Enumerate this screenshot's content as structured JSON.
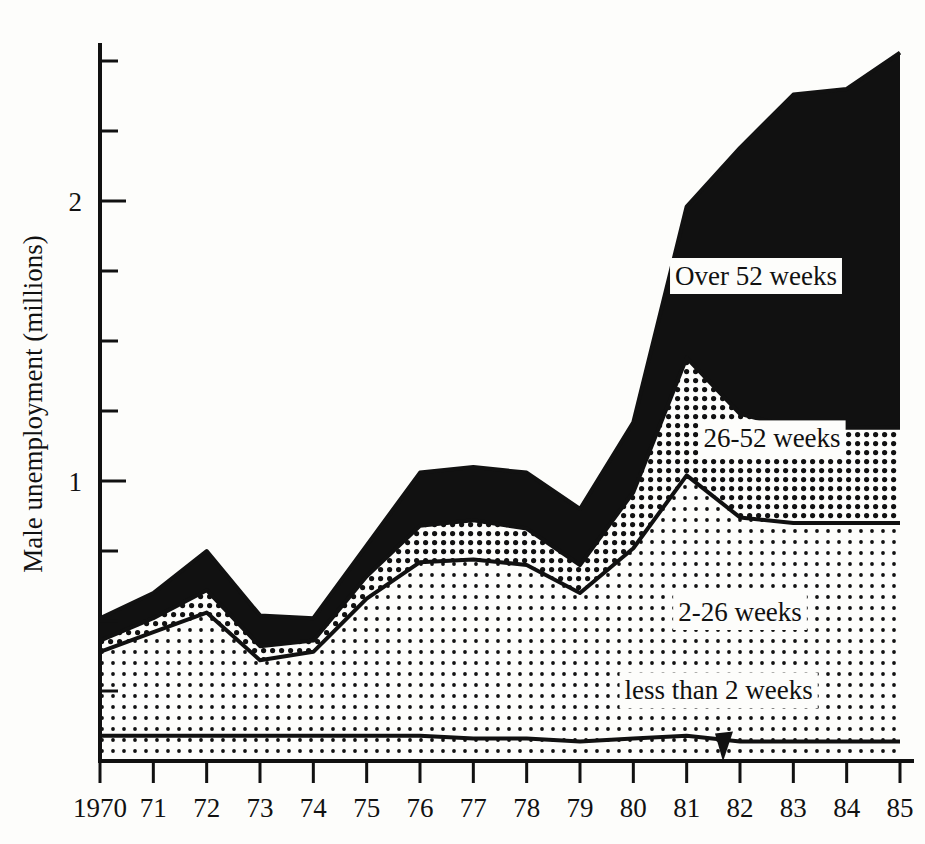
{
  "chart_data": {
    "type": "area",
    "title": "",
    "subtitle": "",
    "xlabel": "",
    "ylabel": "Male unemployment (millions)",
    "stacked": true,
    "grid": false,
    "legend_position": "inline-annotations",
    "xlim": [
      1970,
      1985
    ],
    "ylim": [
      0,
      2.55
    ],
    "yticks_major": [
      1,
      2
    ],
    "yticks_major_labels": [
      "1",
      "2"
    ],
    "ytick_interval_minor": 0.25,
    "x": [
      1970,
      1971,
      1972,
      1973,
      1974,
      1975,
      1976,
      1977,
      1978,
      1979,
      1980,
      1981,
      1982,
      1983,
      1984,
      1985
    ],
    "xtick_labels": [
      "1970",
      "71",
      "72",
      "73",
      "74",
      "75",
      "76",
      "77",
      "78",
      "79",
      "80",
      "81",
      "82",
      "83",
      "84",
      "85"
    ],
    "series": [
      {
        "name": "less than 2 weeks",
        "fill": "light-dots",
        "values": [
          0.09,
          0.09,
          0.09,
          0.09,
          0.09,
          0.09,
          0.09,
          0.08,
          0.08,
          0.07,
          0.08,
          0.09,
          0.07,
          0.07,
          0.07,
          0.07
        ]
      },
      {
        "name": "2-26 weeks",
        "fill": "light-dots",
        "values": [
          0.3,
          0.37,
          0.44,
          0.27,
          0.3,
          0.49,
          0.62,
          0.64,
          0.62,
          0.53,
          0.68,
          0.93,
          0.8,
          0.78,
          0.78,
          0.78
        ]
      },
      {
        "name": "26-52 weeks",
        "fill": "medium-dots",
        "values": [
          0.04,
          0.05,
          0.08,
          0.05,
          0.04,
          0.08,
          0.13,
          0.14,
          0.13,
          0.1,
          0.2,
          0.42,
          0.37,
          0.34,
          0.34,
          0.34
        ]
      },
      {
        "name": "Over 52 weeks",
        "fill": "solid-black",
        "values": [
          0.08,
          0.09,
          0.14,
          0.11,
          0.08,
          0.11,
          0.19,
          0.19,
          0.2,
          0.2,
          0.25,
          0.54,
          0.95,
          1.19,
          1.21,
          1.34
        ]
      }
    ],
    "cumulative_tops": {
      "less_than_2_weeks": [
        0.09,
        0.09,
        0.09,
        0.09,
        0.09,
        0.09,
        0.09,
        0.08,
        0.08,
        0.07,
        0.08,
        0.09,
        0.07,
        0.07,
        0.07,
        0.07
      ],
      "through_2_26_weeks": [
        0.39,
        0.46,
        0.53,
        0.36,
        0.39,
        0.58,
        0.71,
        0.72,
        0.7,
        0.6,
        0.76,
        1.02,
        0.87,
        0.85,
        0.85,
        0.85
      ],
      "through_26_52_weeks": [
        0.43,
        0.51,
        0.61,
        0.41,
        0.43,
        0.66,
        0.84,
        0.86,
        0.83,
        0.7,
        0.96,
        1.44,
        1.24,
        1.19,
        1.19,
        1.19
      ],
      "total": [
        0.51,
        0.6,
        0.75,
        0.52,
        0.51,
        0.77,
        1.03,
        1.05,
        1.03,
        0.9,
        1.21,
        1.98,
        2.19,
        2.38,
        2.4,
        2.53
      ]
    },
    "annotations": [
      {
        "name": "over-52-weeks-label",
        "text": "Over 52 weeks",
        "x": 1982.3,
        "y": 1.7
      },
      {
        "name": "26-52-weeks-label",
        "text": "26-52 weeks",
        "x": 1982.6,
        "y": 1.12
      },
      {
        "name": "2-26-weeks-label",
        "text": "2-26 weeks",
        "x": 1982.0,
        "y": 0.5
      },
      {
        "name": "less-than-2-weeks-label",
        "text": "less than 2 weeks",
        "x": 1981.6,
        "y": 0.22
      },
      {
        "name": "baseline-pointer-arrow",
        "text": "",
        "x": 1981.7,
        "y": 0.02
      }
    ]
  },
  "axes": {
    "y_axis_title": "Male unemployment (millions)",
    "y_tick_1": "1",
    "y_tick_2": "2",
    "x_ticks": [
      "1970",
      "71",
      "72",
      "73",
      "74",
      "75",
      "76",
      "77",
      "78",
      "79",
      "80",
      "81",
      "82",
      "83",
      "84",
      "85"
    ]
  },
  "colors": {
    "ink": "#111111",
    "paper": "#fdfdfb",
    "solid_black": "#111111",
    "medium_dots": "#111111",
    "light_dots": "#111111"
  }
}
